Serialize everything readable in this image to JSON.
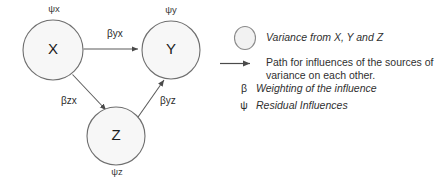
{
  "diagram": {
    "type": "path-diagram",
    "nodes": [
      {
        "id": "X",
        "label": "X",
        "residual_label": "ψx",
        "cx": 53,
        "cy": 50,
        "r": 30
      },
      {
        "id": "Y",
        "label": "Y",
        "residual_label": "ψy",
        "cx": 171,
        "cy": 50,
        "r": 29
      },
      {
        "id": "Z",
        "label": "Z",
        "residual_label": "ψz",
        "cx": 116,
        "cy": 136,
        "r": 29
      }
    ],
    "edges": [
      {
        "id": "x-to-y",
        "from": "X",
        "to": "Y",
        "label": "βyx"
      },
      {
        "id": "x-to-z",
        "from": "X",
        "to": "Z",
        "label": "βzx"
      },
      {
        "id": "z-to-y",
        "from": "Z",
        "to": "Y",
        "label": "βyz"
      }
    ]
  },
  "legend": {
    "items": [
      {
        "symbol_kind": "ellipse-icon",
        "symbol_text": "",
        "text": "Variance from X, Y and Z",
        "style": "italic"
      },
      {
        "symbol_kind": "arrow-icon",
        "symbol_text": "",
        "text_line1": "Path for influences of the sources of",
        "text_line2": "variance on each other.",
        "style": "upright"
      },
      {
        "symbol_kind": "beta-symbol",
        "symbol_text": "β",
        "text": "Weighting of the influence",
        "style": "italic"
      },
      {
        "symbol_kind": "psi-symbol",
        "symbol_text": "ψ",
        "text": "Residual Influences",
        "style": "italic"
      }
    ]
  },
  "colors": {
    "node_fill": "#f7f7f7",
    "node_stroke": "#6e6e6e",
    "line": "#5a5a5a",
    "text": "#303030",
    "background": "#ffffff"
  }
}
